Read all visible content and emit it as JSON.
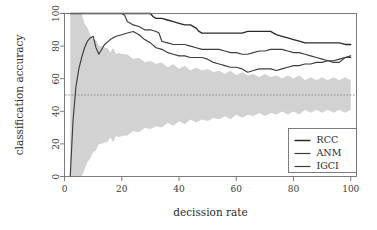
{
  "chart_data": {
    "type": "line",
    "title": "",
    "xlabel": "decission rate",
    "ylabel": "classification accuracy",
    "xlim": [
      0,
      102
    ],
    "ylim": [
      0,
      100
    ],
    "xticks": [
      0,
      20,
      40,
      60,
      80,
      100
    ],
    "yticks": [
      0,
      20,
      40,
      60,
      80,
      100
    ],
    "xtick_labels": [
      "0",
      "20",
      "40",
      "60",
      "80",
      "100"
    ],
    "ytick_labels": [
      "0",
      "20",
      "40",
      "60",
      "80",
      "100"
    ],
    "grid": false,
    "legend_position": "bottom-right",
    "legend_entries": [
      "RCC",
      "ANM",
      "IGCI"
    ],
    "series": [
      {
        "name": "RCC",
        "color": "#2a2a2a",
        "x": [
          2,
          3,
          4,
          5,
          6,
          8,
          10,
          12,
          14,
          16,
          18,
          20,
          21,
          22,
          24,
          26,
          28,
          30,
          31,
          32,
          34,
          36,
          38,
          40,
          42,
          44,
          46,
          47,
          48,
          50,
          52,
          54,
          56,
          58,
          60,
          62,
          64,
          66,
          68,
          70,
          72,
          73,
          74,
          76,
          78,
          80,
          82,
          84,
          86,
          88,
          90,
          92,
          94,
          96,
          98,
          100
        ],
        "values": [
          100,
          100,
          100,
          100,
          100,
          100,
          100,
          100,
          100,
          100,
          100,
          100,
          100,
          100,
          100,
          100,
          100,
          100,
          98,
          97,
          97,
          96,
          95,
          94,
          93,
          93,
          91,
          89,
          88,
          88,
          88,
          88,
          88,
          88,
          88,
          88,
          89,
          89,
          89,
          89,
          89,
          88,
          87,
          86,
          85,
          84,
          83,
          82,
          82,
          82,
          82,
          82,
          82,
          82,
          81,
          81
        ]
      },
      {
        "name": "ANM",
        "color": "#3d3d3d",
        "x": [
          2,
          3,
          4,
          5,
          6,
          8,
          10,
          12,
          14,
          16,
          18,
          20,
          21,
          22,
          23,
          24,
          26,
          28,
          30,
          32,
          33,
          34,
          36,
          38,
          40,
          42,
          44,
          46,
          48,
          50,
          52,
          54,
          56,
          58,
          60,
          62,
          64,
          66,
          68,
          70,
          72,
          74,
          76,
          78,
          80,
          82,
          84,
          86,
          88,
          90,
          92,
          94,
          96,
          98,
          100
        ],
        "values": [
          100,
          100,
          100,
          100,
          100,
          100,
          100,
          100,
          100,
          100,
          100,
          100,
          99,
          95,
          94,
          93,
          92,
          90,
          90,
          89,
          88,
          83,
          82,
          81,
          81,
          81,
          80,
          79,
          78,
          78,
          78,
          78,
          77,
          76,
          76,
          75,
          75,
          76,
          77,
          77,
          78,
          78,
          78,
          77,
          76,
          76,
          75,
          74,
          73,
          72,
          71,
          70,
          70,
          73,
          73
        ]
      },
      {
        "name": "IGCI",
        "color": "#3d3d3d",
        "x": [
          2,
          3,
          4,
          5,
          6,
          7,
          8,
          9,
          10,
          11,
          12,
          14,
          16,
          18,
          20,
          22,
          24,
          26,
          28,
          30,
          32,
          34,
          36,
          38,
          40,
          42,
          44,
          46,
          48,
          50,
          52,
          54,
          56,
          58,
          60,
          62,
          64,
          66,
          68,
          70,
          72,
          74,
          76,
          78,
          80,
          82,
          84,
          86,
          88,
          90,
          92,
          94,
          96,
          98,
          100
        ],
        "values": [
          0,
          35,
          55,
          66,
          73,
          79,
          83,
          85,
          86,
          79,
          75,
          81,
          84,
          86,
          87,
          88,
          89,
          87,
          84,
          82,
          79,
          78,
          76,
          75,
          74,
          74,
          73,
          73,
          73,
          72,
          70,
          69,
          68,
          67,
          67,
          66,
          64,
          65,
          66,
          66,
          66,
          65,
          66,
          67,
          68,
          68,
          69,
          69,
          70,
          70,
          71,
          71,
          72,
          73,
          74
        ]
      }
    ],
    "reference_line": {
      "name": "chance-level",
      "y": 50,
      "style": "dotted",
      "color": "#7a7a7a"
    },
    "confidence_band": {
      "name": "random-baseline-band",
      "color": "#d2d2d2",
      "x": [
        2,
        3,
        4,
        5,
        6,
        7,
        8,
        9,
        10,
        11,
        12,
        13,
        14,
        15,
        16,
        17,
        18,
        19,
        20,
        22,
        24,
        26,
        28,
        30,
        32,
        34,
        36,
        38,
        40,
        42,
        44,
        46,
        48,
        50,
        52,
        54,
        56,
        58,
        60,
        62,
        64,
        66,
        68,
        70,
        72,
        74,
        76,
        78,
        80,
        82,
        84,
        86,
        88,
        90,
        92,
        94,
        96,
        98,
        100
      ],
      "upper": [
        100,
        100,
        100,
        100,
        100,
        93,
        92,
        86,
        85,
        83,
        81,
        79,
        80,
        78,
        77,
        78,
        76,
        75,
        76,
        74,
        73,
        72,
        71,
        70,
        70,
        69,
        68,
        68,
        67,
        67,
        66,
        66,
        66,
        65,
        65,
        64,
        64,
        64,
        63,
        63,
        63,
        62,
        62,
        62,
        62,
        61,
        61,
        61,
        61,
        61,
        60,
        60,
        60,
        60,
        60,
        60,
        60,
        60,
        60
      ],
      "lower": [
        0,
        0,
        0,
        0,
        0,
        5,
        8,
        12,
        14,
        17,
        19,
        21,
        20,
        22,
        23,
        22,
        24,
        25,
        24,
        26,
        27,
        28,
        29,
        30,
        30,
        31,
        32,
        32,
        33,
        33,
        34,
        34,
        34,
        35,
        35,
        36,
        36,
        36,
        37,
        37,
        37,
        38,
        38,
        38,
        38,
        39,
        39,
        39,
        39,
        39,
        40,
        40,
        40,
        40,
        40,
        40,
        40,
        40,
        40
      ]
    }
  },
  "axes": {
    "x_title": "decission rate",
    "y_title": "classification accuracy"
  },
  "legend": {
    "items": [
      {
        "label": "RCC"
      },
      {
        "label": "ANM"
      },
      {
        "label": "IGCI"
      }
    ]
  }
}
